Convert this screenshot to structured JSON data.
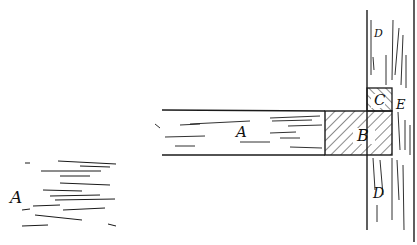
{
  "figure": {
    "type": "patent line drawing",
    "ink_color": "#1a1a1a",
    "background": "#ffffff"
  },
  "labels": {
    "cross_section": "A",
    "board": "A",
    "block_b": "B",
    "block_c": "C",
    "post_top": "D",
    "post_bottom": "D",
    "joint": "E"
  }
}
